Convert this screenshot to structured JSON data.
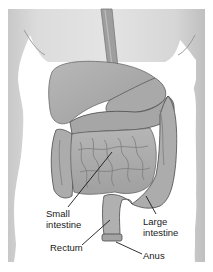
{
  "figure": {
    "labels": {
      "small_intestine": {
        "line1": "Small",
        "line2": "intestine"
      },
      "rectum": "Rectum",
      "large_intestine": {
        "line1": "Large",
        "line2": "intestine"
      },
      "anus": "Anus"
    }
  },
  "colors": {
    "background": "#ffffff",
    "body": "#d9d9d9",
    "body_shadow": "#c4c4c4",
    "organ_light": "#bdbdbd",
    "organ_mid": "#a8a8a8",
    "organ_dark": "#8a8a8a",
    "outline": "#4a4a4a",
    "leader_line": "#1a1a1a",
    "label_text": "#1a1a1a"
  }
}
